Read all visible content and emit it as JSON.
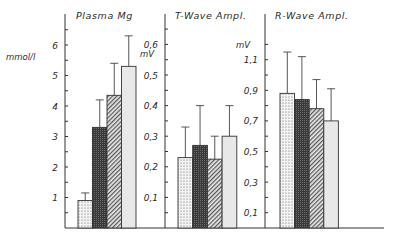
{
  "chart_data": [
    {
      "type": "bar",
      "title": "Plasma Mg",
      "ylabel": "mmol/l",
      "ylim": [
        0,
        6.5
      ],
      "yticks": [
        1,
        2,
        3,
        4,
        5,
        6
      ],
      "ytick_labels": [
        "1",
        "2",
        "3",
        "4",
        "5",
        "6"
      ],
      "categories": [
        "group 1 (dotted)",
        "group 2 (dark crosshatch)",
        "group 3 (diagonal hatch)",
        "group 4 (light)"
      ],
      "values": [
        0.9,
        3.3,
        4.35,
        5.3
      ],
      "error_upper": [
        1.15,
        4.2,
        5.4,
        6.3
      ],
      "grid": false
    },
    {
      "type": "bar",
      "title": "T-Wave Ampl.",
      "ylabel": "mV",
      "ylim": [
        0,
        0.65
      ],
      "yticks": [
        0.1,
        0.2,
        0.3,
        0.4,
        0.5,
        0.6
      ],
      "ytick_labels": [
        "0,1",
        "0,2",
        "0,3",
        "0,4",
        "0,5",
        "0,6"
      ],
      "categories": [
        "group 1 (dotted)",
        "group 2 (dark crosshatch)",
        "group 3 (diagonal hatch)",
        "group 4 (light)"
      ],
      "values": [
        0.23,
        0.27,
        0.225,
        0.3
      ],
      "error_upper": [
        0.33,
        0.4,
        0.3,
        0.4
      ],
      "grid": false
    },
    {
      "type": "bar",
      "title": "R-Wave Ampl.",
      "ylabel": "mV",
      "ylim": [
        0,
        1.2
      ],
      "yticks": [
        0.1,
        0.3,
        0.5,
        0.7,
        0.9,
        1.1
      ],
      "ytick_labels": [
        "0,1",
        "0,3",
        "0,5",
        "0,7",
        "0,9",
        "1,1"
      ],
      "categories": [
        "group 1 (dotted)",
        "group 2 (dark crosshatch)",
        "group 3 (diagonal hatch)",
        "group 4 (light)"
      ],
      "values": [
        0.88,
        0.84,
        0.78,
        0.7
      ],
      "error_upper": [
        1.15,
        1.12,
        0.97,
        0.91
      ],
      "grid": false
    }
  ],
  "panels": [
    {
      "title": "Plasma Mg",
      "unit": "mmol/l"
    },
    {
      "title": "T-Wave Ampl.",
      "unit": "mV"
    },
    {
      "title": "R-Wave Ampl.",
      "unit": "mV"
    }
  ]
}
